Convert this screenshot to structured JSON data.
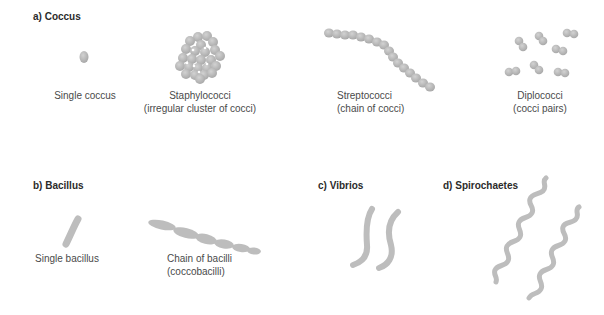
{
  "figure": {
    "colors": {
      "organism_fill": "#b9b9b9",
      "organism_dark": "#a6a6a6",
      "organism_light": "#cfcfcf",
      "heading_text": "#2b2b2b",
      "caption_text": "#4a4a4a",
      "background": "#ffffff"
    },
    "sections": {
      "coccus": {
        "heading": "a) Coccus",
        "items": [
          {
            "name": "single-coccus",
            "line1": "Single coccus",
            "line2": ""
          },
          {
            "name": "staphylococci",
            "line1": "Staphylococci",
            "line2": "(irregular cluster of cocci)"
          },
          {
            "name": "streptococci",
            "line1": "Streptococci",
            "line2": "(chain of cocci)"
          },
          {
            "name": "diplococci",
            "line1": "Diplococci",
            "line2": "(cocci pairs)"
          }
        ]
      },
      "bacillus": {
        "heading": "b) Bacillus",
        "items": [
          {
            "name": "single-bacillus",
            "line1": "Single bacillus",
            "line2": ""
          },
          {
            "name": "chain-of-bacilli",
            "line1": "Chain of bacilli",
            "line2": "(coccobacilli)"
          }
        ]
      },
      "vibrios": {
        "heading": "c) Vibrios"
      },
      "spirochaetes": {
        "heading": "d) Spirochaetes"
      }
    }
  }
}
